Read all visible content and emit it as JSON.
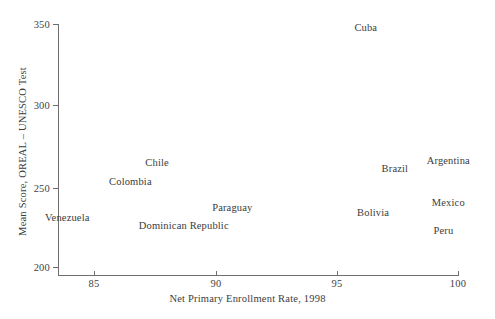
{
  "chart_data": {
    "type": "scatter",
    "title": "",
    "subtitle": "",
    "xlabel": "Net Primary Enrollment Rate, 1998",
    "ylabel": "Mean Score, OREAL – UNESCO Test",
    "xlim": [
      83.5,
      100.5
    ],
    "ylim": [
      195,
      355
    ],
    "xticks": [
      85,
      90,
      95,
      100
    ],
    "xticklabels": [
      "85",
      "90",
      "95",
      "100"
    ],
    "yticks": [
      200,
      250,
      300,
      350
    ],
    "yticklabels": [
      "200",
      "250",
      "300",
      "350"
    ],
    "grid": false,
    "legend": null,
    "marker_style": "text-label-only",
    "points": [
      {
        "label": "Cuba",
        "x": 96.2,
        "y": 348
      },
      {
        "label": "Argentina",
        "x": 99.6,
        "y": 266
      },
      {
        "label": "Brazil",
        "x": 97.4,
        "y": 261
      },
      {
        "label": "Chile",
        "x": 87.6,
        "y": 265
      },
      {
        "label": "Colombia",
        "x": 86.5,
        "y": 253
      },
      {
        "label": "Mexico",
        "x": 99.6,
        "y": 240
      },
      {
        "label": "Paraguay",
        "x": 90.7,
        "y": 237
      },
      {
        "label": "Bolivia",
        "x": 96.5,
        "y": 234
      },
      {
        "label": "Venezuela",
        "x": 83.9,
        "y": 231
      },
      {
        "label": "Peru",
        "x": 99.4,
        "y": 223
      },
      {
        "label": "Dominican Republic",
        "x": 88.7,
        "y": 226
      }
    ]
  },
  "axes": {
    "x_title": "Net Primary Enrollment Rate, 1998",
    "y_title": "Mean Score, OREAL – UNESCO Test",
    "x_tick_labels": [
      "85",
      "90",
      "95",
      "100"
    ],
    "y_tick_labels": [
      "200",
      "250",
      "300",
      "350"
    ]
  },
  "colors": {
    "background": "#ffffff",
    "axis": "#6e6e6e",
    "text": "#3c3c3c"
  }
}
